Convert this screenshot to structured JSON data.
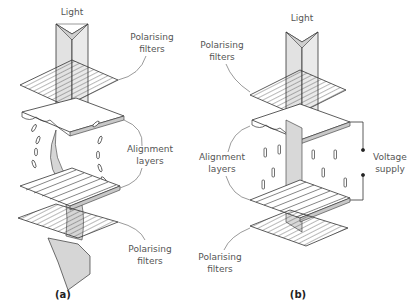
{
  "diagram": {
    "panel_a": {
      "caption": "(a)",
      "labels": {
        "light": "Light",
        "top_filter_1": "Polarising",
        "top_filter_2": "filters",
        "alignment_1": "Alignment",
        "alignment_2": "layers",
        "bottom_filter_1": "Polarising",
        "bottom_filter_2": "filters"
      }
    },
    "panel_b": {
      "caption": "(b)",
      "labels": {
        "light": "Light",
        "top_filter_1": "Polarising",
        "top_filter_2": "filters",
        "alignment_1": "Alignment",
        "alignment_2": "layers",
        "voltage_1": "Voltage",
        "voltage_2": "supply",
        "bottom_filter_1": "Polarising",
        "bottom_filter_2": "filters"
      }
    },
    "colors": {
      "line": "#333333",
      "light_fill": "#d9d9d9",
      "plate_fill": "#ffffff",
      "edge_fill": "#c8c8c8"
    }
  }
}
